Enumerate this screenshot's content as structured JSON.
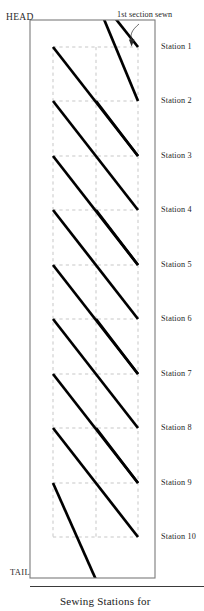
{
  "figure": {
    "caption": "Sewing Stations for",
    "head_label": "HEAD",
    "tail_label": "TAIL",
    "annotation": "1st section sewn",
    "colors": {
      "stitch_line": "#000000",
      "border": "#7b7b7b",
      "grid_dashed": "#b9b9b9",
      "text": "#1a1a1a",
      "background": "#ffffff"
    }
  },
  "stations": [
    {
      "label": "Station 1",
      "y": 47
    },
    {
      "label": "Station 2",
      "y": 101
    },
    {
      "label": "Station 3",
      "y": 156
    },
    {
      "label": "Station 4",
      "y": 210
    },
    {
      "label": "Station 5",
      "y": 265
    },
    {
      "label": "Station 6",
      "y": 319
    },
    {
      "label": "Station 7",
      "y": 374
    },
    {
      "label": "Station 8",
      "y": 428
    },
    {
      "label": "Station 9",
      "y": 483
    },
    {
      "label": "Station 10",
      "y": 537
    }
  ],
  "chart_data": {
    "type": "diagram",
    "title": "Sewing Stations for",
    "xlabel": "",
    "ylabel": "",
    "panel": {
      "x": 30,
      "y": 20,
      "width": 125,
      "height": 558
    },
    "grid": {
      "vertical_x": [
        53,
        96,
        138
      ],
      "horizontal_y": [
        47,
        101,
        156,
        210,
        265,
        319,
        374,
        428,
        483,
        537
      ],
      "style": "dashed"
    },
    "stitch_lines": [
      {
        "name": "stitch-1",
        "x1": 96,
        "y1": -6,
        "x2": 138,
        "y2": 47,
        "note": "enters from top, first section sewn"
      },
      {
        "name": "stitch-2",
        "x1": 96,
        "y1": 0,
        "x2": 138,
        "y2": 101,
        "note": "long diagonal crossing top"
      },
      {
        "name": "stitch-3",
        "x1": 53,
        "y1": 47,
        "x2": 138,
        "y2": 156,
        "note": "full-width diagonal"
      },
      {
        "name": "stitch-4",
        "x1": 96,
        "y1": 101,
        "x2": 138,
        "y2": 156,
        "note": "short segment"
      },
      {
        "name": "stitch-5",
        "x1": 53,
        "y1": 101,
        "x2": 138,
        "y2": 210,
        "note": "full-width diagonal"
      },
      {
        "name": "stitch-6",
        "x1": 53,
        "y1": 156,
        "x2": 138,
        "y2": 265,
        "note": "full-width diagonal"
      },
      {
        "name": "stitch-7",
        "x1": 96,
        "y1": 210,
        "x2": 138,
        "y2": 265,
        "note": "short segment"
      },
      {
        "name": "stitch-8",
        "x1": 53,
        "y1": 210,
        "x2": 138,
        "y2": 319,
        "note": "full-width diagonal"
      },
      {
        "name": "stitch-9",
        "x1": 53,
        "y1": 265,
        "x2": 138,
        "y2": 374,
        "note": "full-width diagonal"
      },
      {
        "name": "stitch-10",
        "x1": 96,
        "y1": 319,
        "x2": 138,
        "y2": 374,
        "note": "short segment"
      },
      {
        "name": "stitch-11",
        "x1": 53,
        "y1": 319,
        "x2": 138,
        "y2": 428,
        "note": "full-width diagonal"
      },
      {
        "name": "stitch-12",
        "x1": 53,
        "y1": 374,
        "x2": 138,
        "y2": 483,
        "note": "full-width diagonal"
      },
      {
        "name": "stitch-13",
        "x1": 96,
        "y1": 428,
        "x2": 138,
        "y2": 483,
        "note": "short segment"
      },
      {
        "name": "stitch-14",
        "x1": 53,
        "y1": 428,
        "x2": 138,
        "y2": 537,
        "note": "full-width diagonal"
      },
      {
        "name": "stitch-15",
        "x1": 53,
        "y1": 483,
        "x2": 105,
        "y2": 600,
        "note": "exits below tail"
      }
    ],
    "annotations": [
      {
        "text": "1st section sewn",
        "x": 118,
        "y": 16,
        "arrow_to": {
          "x": 138,
          "y": 47
        }
      }
    ],
    "axis_labels": [
      {
        "text": "HEAD",
        "x": 6,
        "y": 18
      },
      {
        "text": "TAIL",
        "x": 10,
        "y": 572
      }
    ]
  }
}
